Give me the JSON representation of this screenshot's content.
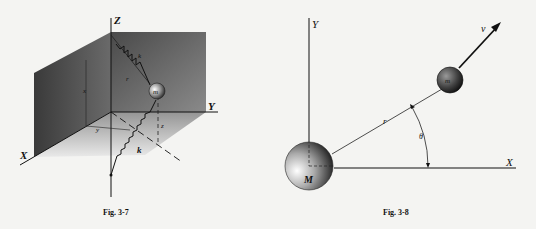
{
  "figures": [
    {
      "caption": "Fig. 3-7",
      "axes": {
        "x": "X",
        "y": "Y",
        "z": "Z"
      },
      "labels": {
        "mass": "m",
        "spring_top": "k",
        "spring_bottom": "k",
        "r": "r",
        "x": "x",
        "y": "y",
        "z": "z"
      }
    },
    {
      "caption": "Fig. 3-8",
      "axes": {
        "x": "X",
        "y": "Y"
      },
      "labels": {
        "big_mass": "M",
        "small_mass": "m",
        "radius": "r",
        "angle": "θ",
        "velocity": "v"
      }
    }
  ]
}
